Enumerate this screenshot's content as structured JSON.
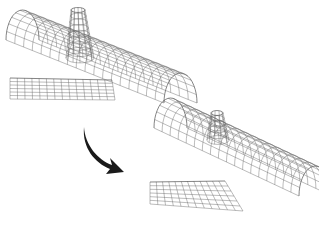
{
  "diagram": {
    "colors": {
      "wire": "#6a6a6a",
      "wire_dark": "#333333",
      "arrow": "#1a1a1a",
      "background": "#ffffff"
    },
    "before": {
      "cylinder": {
        "start": [
          12,
          22
        ],
        "end": [
          170,
          85
        ],
        "radius": 30,
        "u_lines": 18,
        "v_lines": 11
      },
      "cone": {
        "base_center": [
          80,
          58
        ],
        "top_center": [
          78,
          10
        ],
        "base_rx": 14,
        "top_rx": 7,
        "ry_ratio": 0.35,
        "rings": 8,
        "rays": 12
      },
      "panel": {
        "corners": [
          [
            10,
            78
          ],
          [
            112,
            80
          ],
          [
            115,
            100
          ],
          [
            10,
            99
          ]
        ],
        "cols": 14,
        "rows": 6
      }
    },
    "after": {
      "cylinder": {
        "start": [
          160,
          110
        ],
        "end": [
          305,
          178
        ],
        "radius": 30,
        "u_lines": 18,
        "v_lines": 11
      },
      "cone": {
        "base_center": [
          218,
          140
        ],
        "top_center": [
          217,
          113
        ],
        "base_rx": 11,
        "top_rx": 6,
        "ry_ratio": 0.4,
        "rings": 5,
        "rays": 10
      },
      "panel": {
        "corners": [
          [
            150,
            182
          ],
          [
            225,
            181
          ],
          [
            243,
            211
          ],
          [
            150,
            204
          ]
        ],
        "cols": 12,
        "rows": 6
      }
    },
    "arrow": {
      "from": [
        87,
        127
      ],
      "to": [
        121,
        172
      ],
      "label": "transform-arrow"
    }
  }
}
